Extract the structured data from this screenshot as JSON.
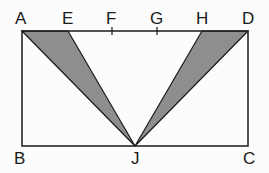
{
  "diagram": {
    "type": "geometry",
    "colors": {
      "stroke": "#1a1a1a",
      "shade": "#8e8e8e",
      "background": "#fcfcfc"
    },
    "points": {
      "A": {
        "label": "A",
        "x": 22,
        "y": 31
      },
      "E": {
        "label": "E",
        "x": 68,
        "y": 31
      },
      "F": {
        "label": "F",
        "x": 112,
        "y": 31
      },
      "G": {
        "label": "G",
        "x": 157,
        "y": 31
      },
      "H": {
        "label": "H",
        "x": 202,
        "y": 31
      },
      "D": {
        "label": "D",
        "x": 248,
        "y": 31
      },
      "B": {
        "label": "B",
        "x": 22,
        "y": 146
      },
      "J": {
        "label": "J",
        "x": 135,
        "y": 146
      },
      "C": {
        "label": "C",
        "x": 248,
        "y": 146
      }
    },
    "shaded_triangles": [
      "AEJ",
      "HDJ"
    ],
    "tick_marks": [
      "F",
      "G"
    ]
  }
}
